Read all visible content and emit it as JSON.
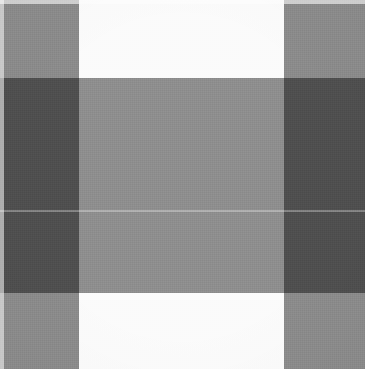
{
  "image": {
    "title": "Gingham plaid fabric swatch",
    "kind": "fabric-texture-swatch",
    "width_px": 365,
    "height_px": 369,
    "alt_text": "Close-up of a grey and white buffalo-check gingham woven fabric",
    "palette": {
      "white": "#fbfbfb",
      "light_gray": "#e7e7e7",
      "medium_gray": "#8b8b8b",
      "dark_gray": "#474747"
    },
    "vertical_bands": [
      {
        "name": "left-gray-column",
        "left_px": 0,
        "width_px": 79,
        "tone": "dark"
      },
      {
        "name": "center-light-column",
        "left_px": 79,
        "width_px": 205,
        "tone": "light"
      },
      {
        "name": "right-gray-column",
        "left_px": 284,
        "width_px": 81,
        "tone": "dark"
      }
    ],
    "horizontal_bands": [
      {
        "name": "top-light-row",
        "top_px": 0,
        "height_px": 78,
        "tone": "light"
      },
      {
        "name": "center-dark-row",
        "top_px": 78,
        "height_px": 215,
        "tone": "dark"
      },
      {
        "name": "bottom-light-row",
        "top_px": 293,
        "height_px": 76,
        "tone": "light"
      }
    ],
    "cells": [
      {
        "name": "cell-top-left",
        "color": "#8b8b8b",
        "shade": "medium-gray"
      },
      {
        "name": "cell-top-center",
        "color": "#fbfbfb",
        "shade": "white"
      },
      {
        "name": "cell-top-right",
        "color": "#8b8b8b",
        "shade": "medium-gray"
      },
      {
        "name": "cell-middle-left",
        "color": "#474747",
        "shade": "dark-gray"
      },
      {
        "name": "cell-middle-center",
        "color": "#e7e7e7",
        "shade": "light-gray"
      },
      {
        "name": "cell-middle-right",
        "color": "#474747",
        "shade": "dark-gray"
      },
      {
        "name": "cell-bottom-left",
        "color": "#8b8b8b",
        "shade": "medium-gray"
      },
      {
        "name": "cell-bottom-center",
        "color": "#fbfbfb",
        "shade": "white"
      },
      {
        "name": "cell-bottom-right",
        "color": "#8b8b8b",
        "shade": "medium-gray"
      }
    ],
    "seam": {
      "name": "horizontal-weave-seam",
      "top_px": 210,
      "color": "#ffffff"
    }
  }
}
